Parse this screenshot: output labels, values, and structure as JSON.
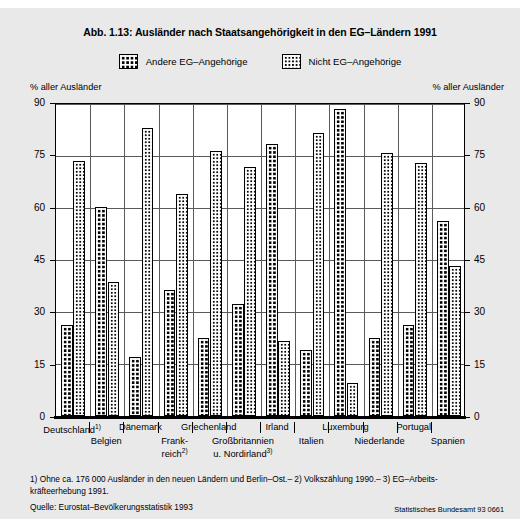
{
  "figure": {
    "title": "Abb. 1.13: Ausländer nach Staatsangehörigkeit in den EG–Ländern 1991",
    "axis_caption_left": "% aller Ausländer",
    "axis_caption_right": "% aller Ausländer",
    "footnotes": "1) Ohne ca. 176 000 Ausländer in den neuen Ländern und Berlin–Ost.– 2) Volkszählung 1990.– 3) EG–Arbeits-kräfteerhebung 1991.",
    "source": "Quelle: Eurostat–Bevölkerungsstatistik 1993",
    "agency": "Statistisches Bundesamt 93 0661"
  },
  "legend": {
    "items": [
      {
        "label": "Andere EG–Angehörige",
        "pattern": "coarse",
        "swatch_icon": "coarse-dot-swatch"
      },
      {
        "label": "Nicht EG–Angehörige",
        "pattern": "fine",
        "swatch_icon": "fine-dot-swatch"
      }
    ]
  },
  "chart_data": {
    "type": "bar",
    "title": "Abb. 1.13: Ausländer nach Staatsangehörigkeit in den EG–Ländern 1991",
    "xlabel": "",
    "ylabel": "% aller Ausländer",
    "ylim": [
      0,
      90
    ],
    "yticks": [
      0,
      15,
      30,
      45,
      60,
      75,
      90
    ],
    "grid": true,
    "legend_position": "top",
    "categories": [
      "Deutschland1)",
      "Belgien",
      "Dänemark",
      "Frankreich2)",
      "Griechenland",
      "Großbritannien u. Nordirland3)",
      "Irland",
      "Italien",
      "Luxemburg",
      "Niederlande",
      "Portugal",
      "Spanien"
    ],
    "series": [
      {
        "name": "Andere EG–Angehörige",
        "values": [
          26,
          60,
          17,
          36,
          22.5,
          32,
          78,
          19,
          88,
          22.5,
          26,
          56
        ]
      },
      {
        "name": "Nicht EG–Angehörige",
        "values": [
          73,
          38.5,
          82.5,
          63.5,
          76,
          71.5,
          21.5,
          81,
          9.5,
          75.5,
          72.5,
          43
        ]
      }
    ]
  },
  "categories_display": [
    {
      "text": "Deutschland",
      "sup": "1)",
      "row": "top"
    },
    {
      "text": "Belgien",
      "sup": "",
      "row": "bottom"
    },
    {
      "text": "Dänemark",
      "sup": "",
      "row": "top"
    },
    {
      "text": "Frank-\nreich",
      "sup": "2)",
      "row": "bottom"
    },
    {
      "text": "Griechenland",
      "sup": "",
      "row": "top"
    },
    {
      "text": "Großbritannien\nu. Nordirland",
      "sup": "3)",
      "row": "bottom"
    },
    {
      "text": "Irland",
      "sup": "",
      "row": "top"
    },
    {
      "text": "Italien",
      "sup": "",
      "row": "bottom"
    },
    {
      "text": "Luxemburg",
      "sup": "",
      "row": "top"
    },
    {
      "text": "Niederlande",
      "sup": "",
      "row": "bottom"
    },
    {
      "text": "Portugal",
      "sup": "",
      "row": "top"
    },
    {
      "text": "Spanien",
      "sup": "",
      "row": "bottom"
    }
  ]
}
